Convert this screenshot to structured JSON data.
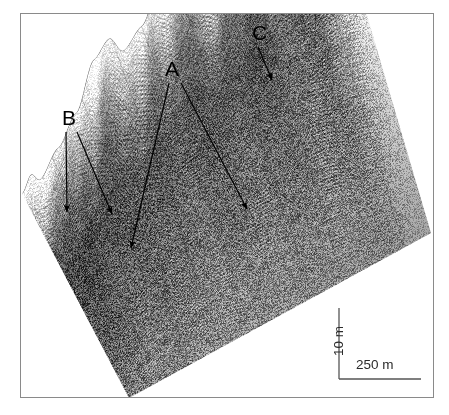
{
  "figure": {
    "type": "seismic-perspective-image",
    "background_color": "#ffffff",
    "frame_color": "#8a8a8a"
  },
  "annotations": [
    {
      "id": "label-a",
      "label": "A",
      "label_x": 164,
      "label_y": 57,
      "arrow_count": 2,
      "arrows": [
        {
          "x1": 168,
          "y1": 82,
          "x2": 130,
          "y2": 247
        },
        {
          "x1": 180,
          "y1": 82,
          "x2": 246,
          "y2": 208
        }
      ]
    },
    {
      "id": "label-b",
      "label": "B",
      "label_x": 61,
      "label_y": 106,
      "arrow_count": 2,
      "arrows": [
        {
          "x1": 65,
          "y1": 131,
          "x2": 66,
          "y2": 211
        },
        {
          "x1": 76,
          "y1": 131,
          "x2": 111,
          "y2": 213
        }
      ]
    },
    {
      "id": "label-c",
      "label": "C",
      "label_x": 251,
      "label_y": 21,
      "arrow_count": 1,
      "arrows": [
        {
          "x1": 257,
          "y1": 46,
          "x2": 271,
          "y2": 79
        }
      ]
    }
  ],
  "scale_bar": {
    "shape": "L",
    "color": "#555555",
    "vertical": {
      "label": "10 m",
      "x": 338,
      "y_top": 307,
      "y_bottom": 378
    },
    "horizontal": {
      "label": "250 m",
      "y": 378,
      "x_left": 338,
      "x_right": 420
    },
    "vertical_label_pos": {
      "x": 330,
      "y": 355
    },
    "horizontal_label_pos": {
      "x": 355,
      "y": 356
    }
  },
  "chart_data": {
    "type": "heatmap",
    "title": "",
    "xlabel": "",
    "ylabel": "",
    "render": "perspective-seismic-block",
    "colormap": "grayscale",
    "block_corners": {
      "left": {
        "x": 21,
        "y": 196
      },
      "top": {
        "x": 320,
        "y": 18
      },
      "right": {
        "x": 430,
        "y": 232
      },
      "bottom": {
        "x": 128,
        "y": 397
      }
    },
    "ridge_profile": [
      {
        "t": 0.0,
        "relief": 0.02
      },
      {
        "t": 0.03,
        "relief": 0.1
      },
      {
        "t": 0.06,
        "relief": 0.04
      },
      {
        "t": 0.12,
        "relief": 0.16
      },
      {
        "t": 0.18,
        "relief": 0.3
      },
      {
        "t": 0.24,
        "relief": 0.55
      },
      {
        "t": 0.29,
        "relief": 0.62
      },
      {
        "t": 0.34,
        "relief": 0.5
      },
      {
        "t": 0.4,
        "relief": 0.58
      },
      {
        "t": 0.47,
        "relief": 0.82
      },
      {
        "t": 0.53,
        "relief": 0.86
      },
      {
        "t": 0.58,
        "relief": 0.7
      },
      {
        "t": 0.63,
        "relief": 0.78
      },
      {
        "t": 0.7,
        "relief": 0.95
      },
      {
        "t": 0.74,
        "relief": 0.88
      },
      {
        "t": 0.79,
        "relief": 0.97
      },
      {
        "t": 0.86,
        "relief": 1.0
      },
      {
        "t": 0.93,
        "relief": 0.96
      },
      {
        "t": 1.0,
        "relief": 0.93
      }
    ],
    "fold_layers": 46,
    "vertical_striping_lines": 9
  }
}
